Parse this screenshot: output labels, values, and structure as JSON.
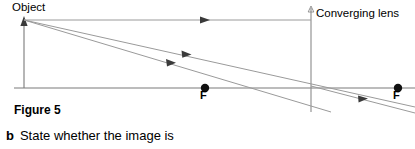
{
  "page": {
    "width": 415,
    "height": 149,
    "background": "#ffffff",
    "ink": "#000000",
    "line_color": "#6b6b6b"
  },
  "diagram": {
    "title_label": "Object",
    "lens_label": "Converging lens",
    "focal_point_left_label": "F",
    "focal_point_right_label": "F",
    "type": "converging-lens-ray-diagram",
    "principal_axis_y": 88,
    "lens_x": 311,
    "object_x": 24,
    "object_tip_y": 20,
    "focal_left_x": 205,
    "focal_right_x": 398,
    "rays": [
      {
        "name": "parallel-ray",
        "from": [
          24,
          20
        ],
        "to": [
          311,
          20
        ],
        "arrow_at": [
          205,
          20
        ]
      },
      {
        "name": "ray-through-centre",
        "from": [
          24,
          20
        ],
        "to": [
          415,
          107
        ],
        "arrow_at": [
          187,
          57
        ]
      },
      {
        "name": "ray-to-focal-point",
        "from": [
          24,
          20
        ],
        "to": [
          330,
          112
        ],
        "arrow_at": [
          172,
          66
        ]
      },
      {
        "name": "refracted-ray",
        "from": [
          311,
          20
        ],
        "to": [
          415,
          99
        ],
        "arrow_at": [
          365,
          101
        ]
      }
    ]
  },
  "figure": {
    "caption": "Figure 5"
  },
  "question": {
    "letter": "b",
    "text": "State whether the image is"
  }
}
